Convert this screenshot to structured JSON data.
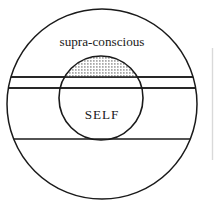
{
  "diagram": {
    "title_label": "supra-conscious",
    "center_label": "SELF",
    "colors": {
      "stroke": "#1a1a1a",
      "background": "#ffffff",
      "stipple_dot": "#2b2b2b",
      "artifact_line": "#d0d0d0"
    },
    "geometry": {
      "outer_circle": {
        "cx": 102,
        "cy": 104,
        "r": 95
      },
      "inner_circle": {
        "cx": 101,
        "cy": 98,
        "r": 42
      },
      "divider_lines_y": [
        77,
        88,
        139
      ]
    },
    "regions": [
      {
        "name": "supra-conscious",
        "label": "supra-conscious"
      },
      {
        "name": "self",
        "label": "SELF"
      },
      {
        "name": "stippled-cap",
        "label": ""
      }
    ]
  }
}
